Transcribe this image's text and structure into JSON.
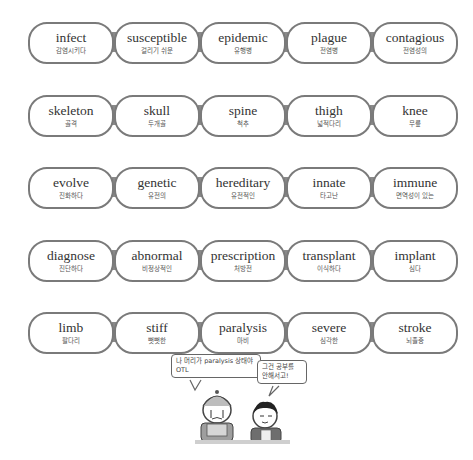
{
  "colors": {
    "pill_border": "#7a7a7a",
    "connector": "#8a8a8a",
    "english_text": "#333333",
    "korean_text": "#555555",
    "background": "#ffffff"
  },
  "rows": [
    {
      "theme": "disease",
      "words": [
        {
          "en": "infect",
          "ko": "감염시키다"
        },
        {
          "en": "susceptible",
          "ko": "걸리기 쉬운"
        },
        {
          "en": "epidemic",
          "ko": "유행병"
        },
        {
          "en": "plague",
          "ko": "전염병"
        },
        {
          "en": "contagious",
          "ko": "전염성의"
        }
      ]
    },
    {
      "theme": "body",
      "words": [
        {
          "en": "skeleton",
          "ko": "골격"
        },
        {
          "en": "skull",
          "ko": "두개골"
        },
        {
          "en": "spine",
          "ko": "척추"
        },
        {
          "en": "thigh",
          "ko": "넓적다리"
        },
        {
          "en": "knee",
          "ko": "무릎"
        }
      ]
    },
    {
      "theme": "genetics",
      "words": [
        {
          "en": "evolve",
          "ko": "진화하다"
        },
        {
          "en": "genetic",
          "ko": "유전의"
        },
        {
          "en": "hereditary",
          "ko": "유전적인"
        },
        {
          "en": "innate",
          "ko": "타고난"
        },
        {
          "en": "immune",
          "ko": "면역성이 있는"
        }
      ]
    },
    {
      "theme": "treatment",
      "words": [
        {
          "en": "diagnose",
          "ko": "진단하다"
        },
        {
          "en": "abnormal",
          "ko": "비정상적인"
        },
        {
          "en": "prescription",
          "ko": "처방전"
        },
        {
          "en": "transplant",
          "ko": "이식하다"
        },
        {
          "en": "implant",
          "ko": "심다"
        }
      ]
    },
    {
      "theme": "symptoms",
      "words": [
        {
          "en": "limb",
          "ko": "팔다리"
        },
        {
          "en": "stiff",
          "ko": "뻣뻣한"
        },
        {
          "en": "paralysis",
          "ko": "마비"
        },
        {
          "en": "severe",
          "ko": "심각한"
        },
        {
          "en": "stroke",
          "ko": "뇌졸중"
        }
      ]
    }
  ],
  "cartoon": {
    "left_bubble": "나 머리가 paralysis 상태야 OTL",
    "right_bubble": "그건 공부를 안해서고!"
  }
}
